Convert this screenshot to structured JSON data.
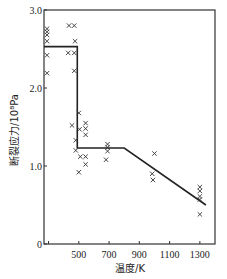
{
  "chart_data": {
    "type": "scatter",
    "title": "",
    "xlabel": "温度/K",
    "ylabel": "断裂应力/10⁸Pa",
    "xlim": [
      270,
      1400
    ],
    "ylim": [
      0,
      3.0
    ],
    "x_ticks": [
      300,
      500,
      700,
      900,
      1100,
      1300
    ],
    "x_tick_labels": [
      "",
      "500",
      "700",
      "900",
      "1100",
      "1300"
    ],
    "y_ticks": [
      0,
      1.0,
      2.0,
      3.0
    ],
    "y_tick_labels": [
      "0",
      "1.0",
      "2.0",
      "3.0"
    ],
    "grid": false,
    "legend": null,
    "series": [
      {
        "name": "measured",
        "marker": "x",
        "points": [
          [
            290,
            2.76
          ],
          [
            290,
            2.72
          ],
          [
            290,
            2.68
          ],
          [
            290,
            2.6
          ],
          [
            290,
            2.42
          ],
          [
            290,
            2.19
          ],
          [
            435,
            2.8
          ],
          [
            470,
            2.8
          ],
          [
            475,
            2.6
          ],
          [
            430,
            2.45
          ],
          [
            470,
            2.45
          ],
          [
            470,
            2.22
          ],
          [
            500,
            1.68
          ],
          [
            455,
            1.52
          ],
          [
            505,
            1.47
          ],
          [
            545,
            1.55
          ],
          [
            545,
            1.48
          ],
          [
            545,
            1.4
          ],
          [
            480,
            1.33
          ],
          [
            480,
            1.2
          ],
          [
            510,
            1.12
          ],
          [
            545,
            1.12
          ],
          [
            545,
            1.02
          ],
          [
            500,
            0.92
          ],
          [
            690,
            1.28
          ],
          [
            690,
            1.24
          ],
          [
            690,
            1.19
          ],
          [
            680,
            1.08
          ],
          [
            1000,
            1.16
          ],
          [
            985,
            0.9
          ],
          [
            990,
            0.82
          ],
          [
            1300,
            0.73
          ],
          [
            1300,
            0.68
          ],
          [
            1300,
            0.61
          ],
          [
            1300,
            0.57
          ],
          [
            1300,
            0.38
          ]
        ]
      },
      {
        "name": "trend",
        "type": "line",
        "points": [
          [
            270,
            2.53
          ],
          [
            490,
            2.53
          ],
          [
            490,
            1.23
          ],
          [
            800,
            1.23
          ],
          [
            1340,
            0.5
          ]
        ]
      }
    ]
  }
}
